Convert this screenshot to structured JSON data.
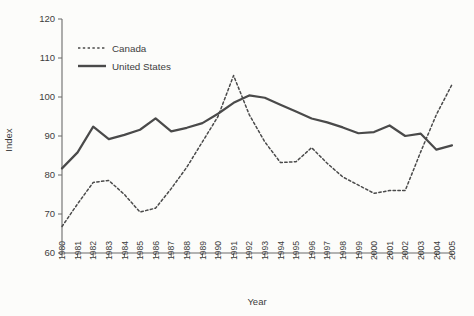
{
  "chart_data": {
    "type": "line",
    "title": "",
    "xlabel": "Year",
    "ylabel": "Index",
    "xlim": [
      1980,
      2005
    ],
    "ylim": [
      60,
      120
    ],
    "ytick_labels": [
      "60",
      "70",
      "80",
      "90",
      "100",
      "110",
      "120"
    ],
    "yticks": [
      60,
      70,
      80,
      90,
      100,
      110,
      120
    ],
    "grid": false,
    "legend_position": "upper-left",
    "categories": [
      "1980",
      "1981",
      "1982",
      "1983",
      "1984",
      "1985",
      "1986",
      "1987",
      "1988",
      "1989",
      "1990",
      "1991",
      "1992",
      "1993",
      "1994",
      "1995",
      "1996",
      "1997",
      "1998",
      "1999",
      "2000",
      "2001",
      "2002",
      "2003",
      "2004",
      "2005"
    ],
    "x": [
      1980,
      1981,
      1982,
      1983,
      1984,
      1985,
      1986,
      1987,
      1988,
      1989,
      1990,
      1991,
      1992,
      1993,
      1994,
      1995,
      1996,
      1997,
      1998,
      1999,
      2000,
      2001,
      2002,
      2003,
      2004,
      2005
    ],
    "series": [
      {
        "name": "Canada",
        "style": "dashed",
        "color": "#4a4a4a",
        "values": [
          66.8,
          72.6,
          78.1,
          78.6,
          75.0,
          70.5,
          71.5,
          76.5,
          82.0,
          88.5,
          95.0,
          105.5,
          95.5,
          88.5,
          83.2,
          83.4,
          87.0,
          83.0,
          79.5,
          77.4,
          75.3,
          76.0,
          76.0,
          86.0,
          95.5,
          103.2
        ]
      },
      {
        "name": "United States",
        "style": "solid",
        "color": "#4a4a4a",
        "values": [
          81.7,
          85.8,
          92.4,
          89.2,
          90.3,
          91.6,
          94.5,
          91.2,
          92.1,
          93.3,
          95.7,
          98.5,
          100.4,
          99.8,
          98.0,
          96.3,
          94.5,
          93.5,
          92.2,
          90.7,
          91.0,
          92.7,
          90.0,
          90.6,
          86.5,
          87.6
        ]
      }
    ]
  },
  "legend": {
    "items": [
      {
        "label": "Canada"
      },
      {
        "label": "United States"
      }
    ]
  },
  "axes": {
    "x_title": "Year",
    "y_title": "Index"
  }
}
